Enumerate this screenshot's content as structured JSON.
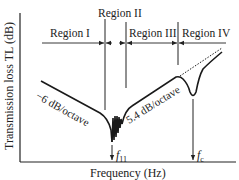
{
  "diagram": {
    "y_axis_label": "Transmission loss TL (dB)",
    "x_axis_label": "Frequency (Hz)",
    "regions": [
      {
        "label": "Region I"
      },
      {
        "label": "Region II"
      },
      {
        "label": "Region III"
      },
      {
        "label": "Region IV"
      }
    ],
    "slopes": {
      "left": "−6 dB/octave",
      "right": "5.4 dB/octave"
    },
    "markers": {
      "f11": {
        "base": "f",
        "sub": "11"
      },
      "fc": {
        "base": "f",
        "sub": "c"
      }
    }
  }
}
